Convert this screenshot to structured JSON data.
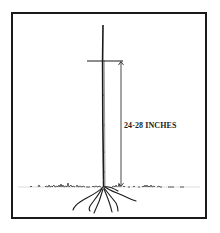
{
  "diagram": {
    "measurement_label": "24-28 INCHES",
    "colors": {
      "ink": "#1a1a1a",
      "background": "#ffffff"
    },
    "elements": [
      "seedling-stem",
      "height-marker",
      "measurement-arrow",
      "ground-line",
      "roots"
    ]
  }
}
